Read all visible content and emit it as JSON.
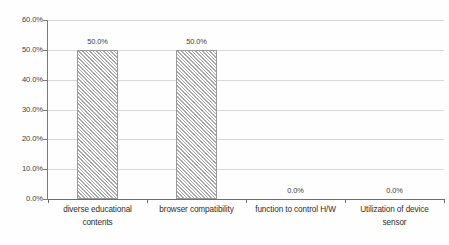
{
  "chart_data": {
    "type": "bar",
    "title": "",
    "subtitle": "",
    "xlabel": "",
    "ylabel": "",
    "categories": [
      "diverse educational contents",
      "browser compatibility",
      "function to control H/W",
      "Utilization of device sensor"
    ],
    "category_lines": [
      [
        "diverse educational",
        "contents"
      ],
      [
        "browser compatibility",
        ""
      ],
      [
        "function to control H/W",
        ""
      ],
      [
        "Utilization of device",
        "sensor"
      ]
    ],
    "values": [
      50.0,
      50.0,
      0.0,
      0.0
    ],
    "data_labels": [
      "50.0%",
      "50.0%",
      "0.0%",
      "0.0%"
    ],
    "ylim": [
      0,
      60
    ],
    "ytick_values": [
      0,
      10,
      20,
      30,
      40,
      50,
      60
    ],
    "ytick_labels": [
      "0.0%",
      "10.0%",
      "20.0%",
      "30.0%",
      "40.0%",
      "50.0%",
      "60.0%"
    ],
    "grid": true,
    "grid_axis": "y",
    "legend": false,
    "legend_position": "none",
    "bar_fill": "diagonal-hatch",
    "colors": {
      "bar_hatch": "#a8a8a8",
      "bar_background": "#ffffff",
      "bar_border": "#9a9a9a",
      "gridline": "#d9d9d9",
      "axis": "#6e6e6e",
      "text": "#3d3d3d",
      "plot_background": "#ffffff"
    }
  }
}
